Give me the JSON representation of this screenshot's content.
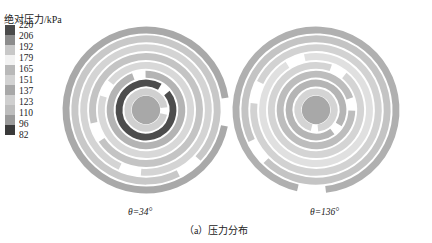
{
  "legend": {
    "title": "绝对压力/kPa",
    "ticks": [
      "220",
      "206",
      "192",
      "179",
      "165",
      "151",
      "137",
      "123",
      "110",
      "96",
      "82"
    ],
    "colors": [
      "#4a4a4a",
      "#8c8c8c",
      "#c8c8c8",
      "#f2f2f2",
      "#b8b8b8",
      "#d2d2d2",
      "#a8a8a8",
      "#cfcfcf",
      "#bdbdbd",
      "#9a9a9a",
      "#3a3a3a"
    ]
  },
  "panels": [
    {
      "label": "θ=34°",
      "rings": [
        {
          "color": "#a9a9a9"
        },
        {
          "color": "#c8c8c8"
        },
        {
          "color": "#d4d4d4"
        },
        {
          "color": "#c4c4c4"
        },
        {
          "color": "#d8d8d8"
        },
        {
          "color": "#b4b4b4"
        },
        {
          "color": "#4d4d4d"
        },
        {
          "color": "#d0d0d0"
        },
        {
          "color": "#a8a8a8"
        }
      ]
    },
    {
      "label": "θ=136°",
      "rings": [
        {
          "color": "#b0b0b0"
        },
        {
          "color": "#c4c4c4"
        },
        {
          "color": "#d2d2d2"
        },
        {
          "color": "#e0e0e0"
        },
        {
          "color": "#d4d4d4"
        },
        {
          "color": "#bdbdbd"
        },
        {
          "color": "#b5b5b5"
        },
        {
          "color": "#d4d4d4"
        },
        {
          "color": "#a8a8a8"
        }
      ]
    }
  ],
  "caption": "（a）压力分布"
}
